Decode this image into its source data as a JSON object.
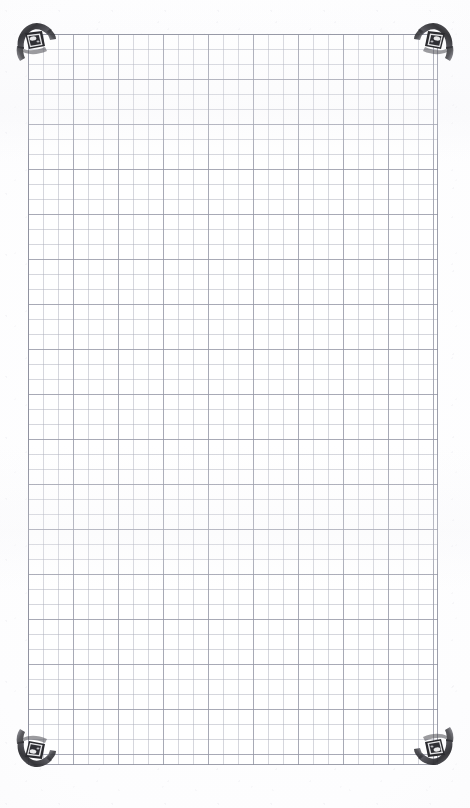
{
  "document": {
    "title": "Scanned grid paper sheet",
    "type": "graph-paper-scan",
    "page_width": 470,
    "page_height": 808,
    "background_color": "#fefeff",
    "text_content": "",
    "annotations": []
  },
  "sheet": {
    "name": "grid-paper",
    "left": 28,
    "top": 34,
    "width": 410,
    "height": 731,
    "cell_size": 15,
    "major_every": 3,
    "major_size": 45,
    "columns": 27,
    "rows": 48,
    "minor_line_color": "#b0b2be",
    "major_line_color": "#9698a6",
    "frame_line_color": "#8c8e9c",
    "paper_color": "#ffffff"
  },
  "corner_clips": {
    "count": 4,
    "label": "metallic photo corner clip",
    "body_color": "#3a3a3e",
    "highlight_color": "#f2f2f4",
    "shadow_color": "#1a1a1d",
    "items": [
      {
        "name": "corner-clip-top-left",
        "position": "top-left"
      },
      {
        "name": "corner-clip-top-right",
        "position": "top-right"
      },
      {
        "name": "corner-clip-bottom-left",
        "position": "bottom-left"
      },
      {
        "name": "corner-clip-bottom-right",
        "position": "bottom-right"
      }
    ]
  }
}
